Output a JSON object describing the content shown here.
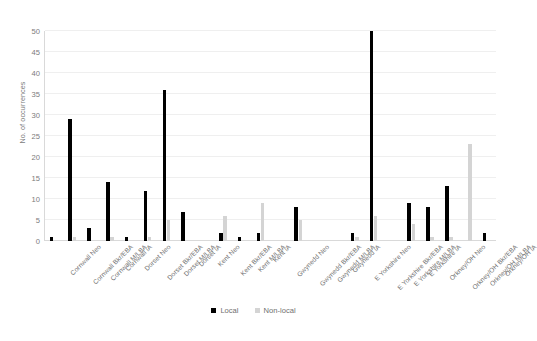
{
  "chart_data": {
    "type": "bar",
    "title": "",
    "xlabel": "",
    "ylabel": "No. of occurrences",
    "ylim": [
      0,
      50
    ],
    "yticks": [
      0,
      5,
      10,
      15,
      20,
      25,
      30,
      35,
      40,
      45,
      50
    ],
    "grid": true,
    "legend_position": "bottom",
    "categories": [
      "Cornwall Neo",
      "Cornwall Bkr/EBA",
      "Cornwall M/LBA",
      "Cornwall IA",
      "Dorset Neo",
      "Dorset Bkr/EBA",
      "Dorset M/LBA",
      "Dorset IA",
      "Kent Neo",
      "Kent Bkr/EBA",
      "Kent M/LBA",
      "Kent IA",
      "Gwynedd Neo",
      "Gwynedd Bkr/EBA",
      "Gwynedd M/LBA",
      "Gwynedd IA",
      "E Yorkshire Neo",
      "E Yorkshire Bkr/EBA",
      "E Yorkshire M/LBA",
      "E Yorkshire IA",
      "Orkney/OH Neo",
      "Orkney/OH Bkr/EBA",
      "Orkney/OH M/LBA",
      "Orkney/OH IA"
    ],
    "series": [
      {
        "name": "Local",
        "color": "#000000",
        "values": [
          1,
          29,
          3,
          14,
          1,
          12,
          36,
          7,
          0,
          2,
          1,
          2,
          0,
          8,
          0,
          0,
          2,
          50,
          0,
          9,
          8,
          13,
          0,
          2
        ]
      },
      {
        "name": "Non-local",
        "color": "#d4d4d4",
        "values": [
          0,
          1,
          0,
          1,
          0,
          1,
          5,
          0,
          0,
          6,
          0,
          9,
          0,
          5,
          0,
          0,
          1,
          6,
          0,
          4,
          1,
          1,
          23,
          0
        ]
      }
    ]
  },
  "legend": {
    "items": [
      {
        "label": "Local",
        "color": "#000000"
      },
      {
        "label": "Non-local",
        "color": "#d4d4d4"
      }
    ]
  },
  "axis": {
    "y_title": "No. of occurrences"
  }
}
